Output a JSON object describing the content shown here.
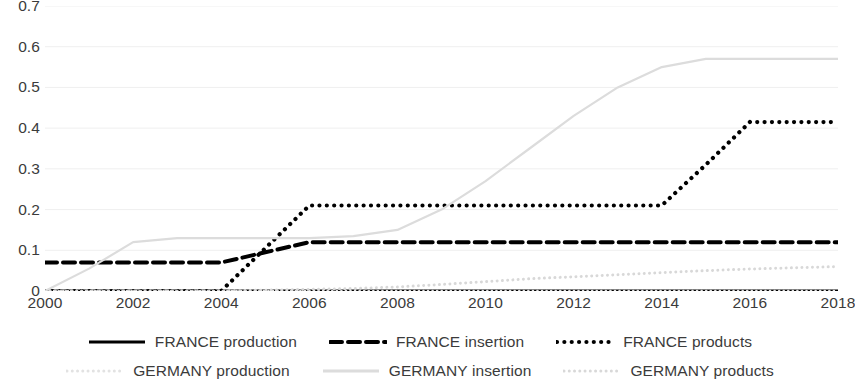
{
  "chart_data": {
    "type": "line",
    "title": "",
    "subtitle": "",
    "xlabel": "",
    "ylabel": "",
    "xlim": [
      2000,
      2018
    ],
    "ylim": [
      0,
      0.7
    ],
    "grid": true,
    "legend_position": "bottom",
    "x_tick_labels": [
      "2000",
      "2002",
      "2004",
      "2006",
      "2008",
      "2010",
      "2012",
      "2014",
      "2016",
      "2018"
    ],
    "x_tick_values": [
      2000,
      2002,
      2004,
      2006,
      2008,
      2010,
      2012,
      2014,
      2016,
      2018
    ],
    "y_tick_labels": [
      "0.7",
      "0.6",
      "0.5",
      "0.4",
      "0.3",
      "0.2",
      "0.1",
      "0"
    ],
    "y_tick_values": [
      0.7,
      0.6,
      0.5,
      0.4,
      0.3,
      0.2,
      0.1,
      0
    ],
    "x": [
      2000,
      2001,
      2002,
      2003,
      2004,
      2005,
      2006,
      2007,
      2008,
      2009,
      2010,
      2011,
      2012,
      2013,
      2014,
      2015,
      2016,
      2017,
      2018
    ],
    "series": [
      {
        "name": "FRANCE production",
        "style": "solid",
        "color": "#000000",
        "width": 3.2,
        "values": [
          0,
          0,
          0,
          0,
          0,
          0,
          0,
          0,
          0,
          0,
          0,
          0,
          0,
          0,
          0,
          0,
          0,
          0,
          0
        ]
      },
      {
        "name": "FRANCE insertion",
        "style": "dashed",
        "color": "#000000",
        "width": 4.0,
        "values": [
          0.07,
          0.07,
          0.07,
          0.07,
          0.07,
          0.095,
          0.12,
          0.12,
          0.12,
          0.12,
          0.12,
          0.12,
          0.12,
          0.12,
          0.12,
          0.12,
          0.12,
          0.12,
          0.12
        ]
      },
      {
        "name": "FRANCE products",
        "style": "dotted",
        "color": "#000000",
        "width": 4.2,
        "values": [
          0,
          0,
          0,
          0,
          0,
          0.105,
          0.21,
          0.21,
          0.21,
          0.21,
          0.21,
          0.21,
          0.21,
          0.21,
          0.21,
          0.31,
          0.415,
          0.415,
          0.415
        ]
      },
      {
        "name": "GERMANY production",
        "style": "dotted",
        "color": "#e2e2e2",
        "width": 2.6,
        "values": [
          0,
          0,
          0,
          0,
          0,
          0,
          0,
          0,
          0,
          0,
          0,
          0,
          0,
          0,
          0,
          0,
          0,
          0,
          0
        ]
      },
      {
        "name": "GERMANY insertion",
        "style": "solid",
        "color": "#dcdcdc",
        "width": 2.2,
        "values": [
          0,
          0.055,
          0.12,
          0.13,
          0.13,
          0.13,
          0.13,
          0.135,
          0.15,
          0.2,
          0.27,
          0.35,
          0.43,
          0.5,
          0.55,
          0.57,
          0.57,
          0.57,
          0.57
        ]
      },
      {
        "name": "GERMANY products",
        "style": "dotted",
        "color": "#d8d8d8",
        "width": 3.0,
        "values": [
          0,
          0,
          0,
          0,
          0,
          0.002,
          0.004,
          0.006,
          0.01,
          0.016,
          0.023,
          0.03,
          0.035,
          0.04,
          0.045,
          0.05,
          0.054,
          0.057,
          0.06
        ]
      }
    ]
  },
  "legend": {
    "items": [
      {
        "label": "FRANCE production",
        "icon": "solid-line-swatch"
      },
      {
        "label": "FRANCE insertion",
        "icon": "dashed-line-swatch"
      },
      {
        "label": "FRANCE products",
        "icon": "dotted-line-swatch"
      },
      {
        "label": "GERMANY production",
        "icon": "light-dotted-line-swatch"
      },
      {
        "label": "GERMANY insertion",
        "icon": "light-solid-line-swatch"
      },
      {
        "label": "GERMANY products",
        "icon": "light-dotted-line-swatch"
      }
    ]
  }
}
